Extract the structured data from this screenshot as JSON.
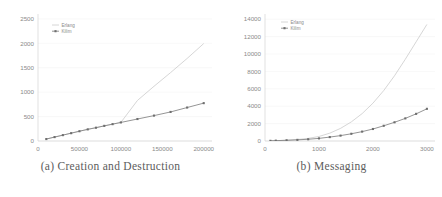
{
  "figure": {
    "subfigures": [
      {
        "id": "creation-destruction",
        "caption": "(a) Creation and Destruction"
      },
      {
        "id": "messaging",
        "caption": "(b) Messaging"
      }
    ]
  },
  "colors": {
    "erlang": "#c8c8c8",
    "kilim": "#7a7a7a",
    "grid": "#f0f0f0",
    "axis": "#cfcfcf",
    "tick_text": "#8a8a8a",
    "caption_text": "#5c5c5c",
    "background": "#ffffff"
  },
  "chart_data": [
    {
      "type": "line",
      "title": "(a) Creation and Destruction",
      "xlabel": "",
      "ylabel": "",
      "xlim": [
        0,
        210000
      ],
      "ylim": [
        0,
        2600
      ],
      "xticks": [
        0,
        50000,
        100000,
        150000,
        200000
      ],
      "xticklabels": [
        "0",
        "50000",
        "100000",
        "150000",
        "200000"
      ],
      "yticks": [
        0,
        500,
        1000,
        1500,
        2000,
        2500
      ],
      "yticklabels": [
        "0",
        "500",
        "1000",
        "1500",
        "2000",
        "2500"
      ],
      "grid": true,
      "legend": [
        "Erlang",
        "Kilim"
      ],
      "legend_position": "upper left",
      "series": [
        {
          "name": "Erlang",
          "marker": "none",
          "x": [
            10000,
            20000,
            30000,
            40000,
            50000,
            60000,
            70000,
            80000,
            90000,
            100000,
            120000,
            140000,
            160000,
            180000,
            200000
          ],
          "y": [
            40,
            80,
            120,
            160,
            200,
            240,
            275,
            310,
            345,
            380,
            830,
            1120,
            1400,
            1690,
            1995
          ]
        },
        {
          "name": "Kilim",
          "marker": "square",
          "x": [
            10000,
            20000,
            30000,
            40000,
            50000,
            60000,
            70000,
            80000,
            90000,
            100000,
            120000,
            140000,
            160000,
            180000,
            200000
          ],
          "y": [
            40,
            80,
            120,
            160,
            200,
            238,
            272,
            310,
            345,
            380,
            450,
            520,
            595,
            685,
            775
          ]
        }
      ]
    },
    {
      "type": "line",
      "title": "(b) Messaging",
      "xlabel": "",
      "ylabel": "",
      "xlim": [
        0,
        3150
      ],
      "ylim": [
        0,
        14600
      ],
      "xticks": [
        0,
        1000,
        2000,
        3000
      ],
      "xticklabels": [
        "0",
        "1000",
        "2000",
        "3000"
      ],
      "yticks": [
        0,
        2000,
        4000,
        6000,
        8000,
        10000,
        12000,
        14000
      ],
      "yticklabels": [
        "0",
        "2000",
        "4000",
        "6000",
        "8000",
        "10000",
        "12000",
        "14000"
      ],
      "grid": true,
      "legend": [
        "Erlang",
        "Kilim"
      ],
      "legend_position": "upper left",
      "series": [
        {
          "name": "Erlang",
          "marker": "none",
          "x": [
            100,
            200,
            400,
            600,
            800,
            1000,
            1200,
            1400,
            1600,
            1800,
            2000,
            2200,
            2400,
            2600,
            2800,
            3000
          ],
          "y": [
            20,
            40,
            90,
            170,
            300,
            520,
            900,
            1450,
            2200,
            3150,
            4350,
            5800,
            7500,
            9400,
            11400,
            13400
          ]
        },
        {
          "name": "Kilim",
          "marker": "square",
          "x": [
            100,
            200,
            400,
            600,
            800,
            1000,
            1200,
            1400,
            1600,
            1800,
            2000,
            2200,
            2400,
            2600,
            2800,
            3000
          ],
          "y": [
            20,
            40,
            80,
            130,
            200,
            300,
            450,
            620,
            830,
            1080,
            1380,
            1750,
            2150,
            2600,
            3120,
            3700
          ]
        }
      ]
    }
  ]
}
